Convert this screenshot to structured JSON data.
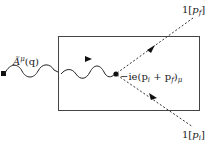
{
  "diagram": {
    "type": "feynman-vertex",
    "box": {
      "x": 58,
      "y": 36,
      "width": 141,
      "height": 74
    },
    "external_source_marker": "square",
    "photon_label": {
      "base": "Ã",
      "sup": "μ",
      "arg": "(q)"
    },
    "vertex_factor": {
      "prefix": "−ie(p",
      "sub1": "i",
      "mid": " + p",
      "sub2": "f",
      "close": ")",
      "sub3": "μ"
    },
    "outgoing_label": {
      "coef": "1[",
      "var": "p",
      "sub": "f",
      "close": "]"
    },
    "incoming_label": {
      "coef": "1[",
      "var": "p",
      "sub": "i",
      "close": "]"
    },
    "lines": [
      {
        "kind": "photon-wavy",
        "from": "source",
        "to": "vertex"
      },
      {
        "kind": "scalar-dashed",
        "from": "vertex",
        "to": "outgoing",
        "momentum": "p_f"
      },
      {
        "kind": "scalar-dashed",
        "from": "incoming",
        "to": "vertex",
        "momentum": "p_i"
      }
    ]
  }
}
